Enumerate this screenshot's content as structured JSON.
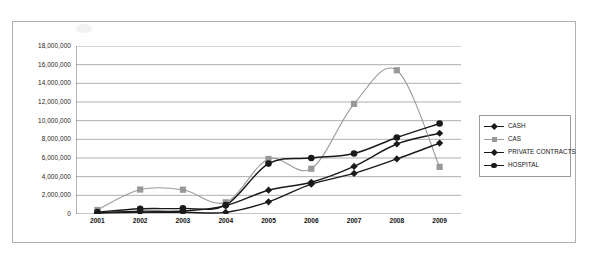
{
  "chart_data": {
    "type": "line",
    "title": "",
    "xlabel": "",
    "ylabel": "",
    "categories": [
      "2001",
      "2002",
      "2003",
      "2004",
      "2005",
      "2006",
      "2007",
      "2008",
      "2009"
    ],
    "ylim": [
      0,
      18000000
    ],
    "ytick_values": [
      0,
      2000000,
      4000000,
      6000000,
      8000000,
      10000000,
      12000000,
      14000000,
      16000000,
      18000000
    ],
    "ytick_labels": [
      "0",
      "2,000,000",
      "4,000,000",
      "6,000,000",
      "8,000,000",
      "10,000,000",
      "12,000,000",
      "14,000,000",
      "16,000,000",
      "18,000,000"
    ],
    "grid": true,
    "legend_position": "right",
    "series": [
      {
        "name": "CASH",
        "color": "#1a1a1a",
        "marker": "diamond",
        "values": [
          120000,
          300000,
          320000,
          900000,
          2550000,
          3400000,
          5100000,
          7500000,
          8650000
        ]
      },
      {
        "name": "CAS",
        "color": "#999999",
        "marker": "square",
        "values": [
          430000,
          2620000,
          2600000,
          1250000,
          5900000,
          4850000,
          11800000,
          15400000,
          5050000
        ]
      },
      {
        "name": "PRIVATE CONTRACTS",
        "color": "#1a1a1a",
        "marker": "diamond",
        "values": [
          120000,
          180000,
          180000,
          180000,
          1300000,
          3200000,
          4350000,
          5900000,
          7600000
        ]
      },
      {
        "name": "HOSPITAL",
        "color": "#1a1a1a",
        "marker": "circle",
        "values": [
          200000,
          560000,
          600000,
          950000,
          5400000,
          6000000,
          6480000,
          8200000,
          9700000
        ]
      }
    ]
  },
  "legend": {
    "items": [
      {
        "label": "CASH"
      },
      {
        "label": "CAS"
      },
      {
        "label": "PRIVATE CONTRACTS"
      },
      {
        "label": "HOSPITAL"
      }
    ]
  }
}
